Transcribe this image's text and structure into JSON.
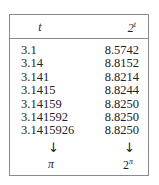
{
  "table": {
    "headers": [
      "t",
      "2",
      "t"
    ],
    "rows": [
      {
        "t": "3.1",
        "value": "8.5742"
      },
      {
        "t": "3.14",
        "value": "8.8152"
      },
      {
        "t": "3.141",
        "value": "8.8214"
      },
      {
        "t": "3.1415",
        "value": "8.8244"
      },
      {
        "t": "3.14159",
        "value": "8.8250"
      },
      {
        "t": "3.141592",
        "value": "8.8250"
      },
      {
        "t": "3.1415926",
        "value": "8.8250"
      }
    ],
    "footer": {
      "arrow": "↓",
      "limit_t": "π",
      "limit_base": "2",
      "limit_exp": "π"
    }
  }
}
